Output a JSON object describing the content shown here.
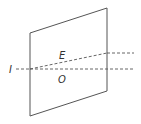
{
  "diagram": {
    "title": "",
    "labels": {
      "incident": "I",
      "extraordinary": "E",
      "ordinary": "O"
    },
    "colors": {
      "stroke": "#555555",
      "text": "#333333",
      "background": "#ffffff"
    },
    "elements": [
      {
        "type": "plate",
        "shape": "parallelogram"
      },
      {
        "type": "ray",
        "name": "incident",
        "style": "dashed"
      },
      {
        "type": "ray",
        "name": "ordinary",
        "style": "dashed"
      },
      {
        "type": "ray",
        "name": "extraordinary",
        "style": "dashed"
      }
    ]
  }
}
